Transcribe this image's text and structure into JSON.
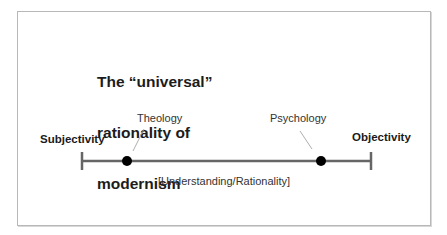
{
  "title": {
    "line1": "The “universal”",
    "line2": "rationality of",
    "line3": "modernism"
  },
  "axis": {
    "left_label": "Subjectivity",
    "right_label": "Objectivity",
    "caption": "[Understanding/Rationality]"
  },
  "points": [
    {
      "label": "Theology"
    },
    {
      "label": "Psychology"
    }
  ],
  "colors": {
    "axis_line": "#666666",
    "point": "#000000",
    "frame": "#b8b8b8"
  }
}
